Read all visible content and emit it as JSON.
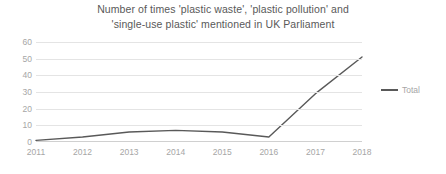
{
  "chart_data": {
    "type": "line",
    "title": "Number of times 'plastic waste', 'plastic pollution' and 'single-use plastic' mentioned in UK Parliament",
    "title_lines": [
      "Number of times 'plastic waste', 'plastic pollution' and",
      "'single-use plastic' mentioned in UK Parliament"
    ],
    "categories": [
      "2011",
      "2012",
      "2013",
      "2014",
      "2015",
      "2016",
      "2017",
      "2018"
    ],
    "series": [
      {
        "name": "Total",
        "values": [
          1,
          3,
          6,
          7,
          6,
          3,
          29,
          51
        ],
        "color": "#595959"
      }
    ],
    "xlabel": "",
    "ylabel": "",
    "ylim": [
      0,
      60
    ],
    "yticks": [
      0,
      10,
      20,
      30,
      40,
      50,
      60
    ],
    "grid": true,
    "legend_position": "right"
  },
  "legend": {
    "entries": [
      {
        "label": "Total",
        "swatch": "line-swatch"
      }
    ]
  },
  "colors": {
    "series_line": "#595959",
    "gridline": "#e4e4e4",
    "axis": "#d0d0d0",
    "tick_text": "#a6a6a6",
    "title_text": "#595959",
    "background": "#ffffff"
  }
}
